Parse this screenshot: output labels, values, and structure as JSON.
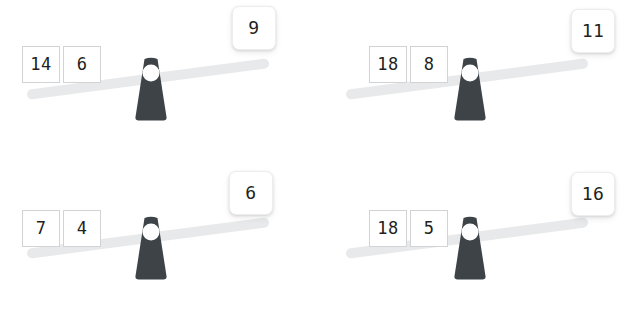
{
  "puzzle": {
    "type": "balance-scale-set",
    "background_color": "#ffffff",
    "beam_color": "#e8e9ea",
    "fulcrum_color": "#3d4347",
    "tile_text_color": "#231f20",
    "panels": [
      {
        "id": "panel-top-left",
        "left_weights": [
          "14",
          "6"
        ],
        "right_weights": [
          "9"
        ],
        "tilt": "left-down",
        "tilt_degrees": -7.5
      },
      {
        "id": "panel-top-right",
        "left_weights": [
          "18",
          "8"
        ],
        "right_weights": [
          "11"
        ],
        "tilt": "left-down",
        "tilt_degrees": -7.5
      },
      {
        "id": "panel-bottom-left",
        "left_weights": [
          "7",
          "4"
        ],
        "right_weights": [
          "6"
        ],
        "tilt": "left-down",
        "tilt_degrees": -7.5
      },
      {
        "id": "panel-bottom-right",
        "left_weights": [
          "18",
          "5"
        ],
        "right_weights": [
          "16"
        ],
        "tilt": "left-down",
        "tilt_degrees": -7.5
      }
    ]
  }
}
